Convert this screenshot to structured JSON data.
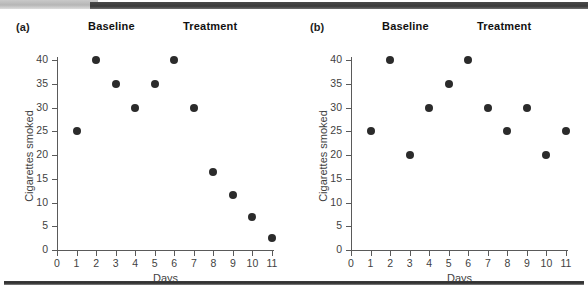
{
  "figure": {
    "panels": [
      {
        "tag": "(a)",
        "phase_labels": {
          "baseline": "Baseline",
          "treatment": "Treatment"
        }
      },
      {
        "tag": "(b)",
        "phase_labels": {
          "baseline": "Baseline",
          "treatment": "Treatment"
        }
      }
    ],
    "axis": {
      "x_title": "Days",
      "y_title": "Cigarettes smoked",
      "x_ticks": [
        "0",
        "1",
        "2",
        "3",
        "4",
        "5",
        "6",
        "7",
        "8",
        "9",
        "10",
        "11"
      ],
      "y_ticks": [
        "0",
        "5",
        "10",
        "15",
        "20",
        "25",
        "30",
        "35",
        "40"
      ]
    },
    "colors": {
      "dot": "#2b2b2b",
      "axis": "#5a5a5a",
      "text": "#3f3f3f",
      "band_dark": "#3a3a3a",
      "band_light": "#c9c9c9"
    }
  },
  "chart_data": [
    {
      "type": "scatter",
      "title": "(a)",
      "xlabel": "Days",
      "ylabel": "Cigarettes smoked",
      "xlim": [
        0,
        11
      ],
      "ylim": [
        0,
        40
      ],
      "grid": false,
      "legend": "none",
      "annotations": [
        "Baseline",
        "Treatment"
      ],
      "phase_split_day": 6,
      "x": [
        1,
        2,
        3,
        4,
        5,
        6,
        7,
        8,
        9,
        10,
        11
      ],
      "values": [
        25,
        40,
        35,
        30,
        35,
        40,
        30,
        16.5,
        11.5,
        7,
        2.5
      ]
    },
    {
      "type": "scatter",
      "title": "(b)",
      "xlabel": "Days",
      "ylabel": "Cigarettes smoked",
      "xlim": [
        0,
        11
      ],
      "ylim": [
        0,
        40
      ],
      "grid": false,
      "legend": "none",
      "annotations": [
        "Baseline",
        "Treatment"
      ],
      "phase_split_day": 6,
      "x": [
        1,
        2,
        3,
        4,
        5,
        6,
        7,
        8,
        9,
        10,
        11
      ],
      "values": [
        25,
        40,
        20,
        30,
        35,
        40,
        30,
        25,
        30,
        20,
        25
      ]
    }
  ]
}
